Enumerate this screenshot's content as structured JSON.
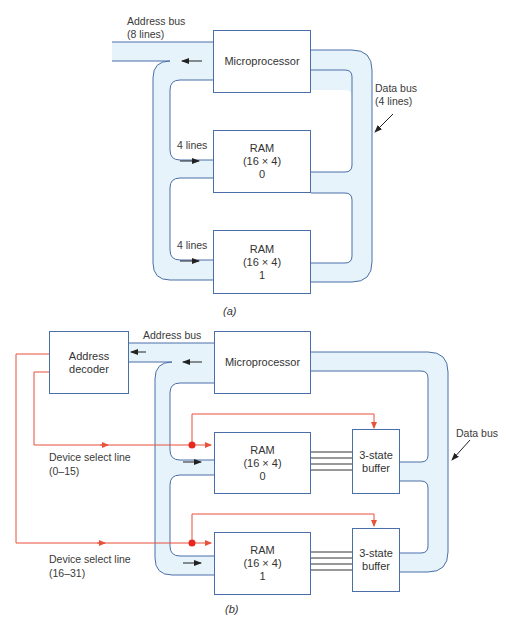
{
  "diagram_a": {
    "caption": "(a)",
    "address_bus_label_1": "Address bus",
    "address_bus_label_2": "(8 lines)",
    "data_bus_label_1": "Data bus",
    "data_bus_label_2": "(4 lines)",
    "microprocessor": "Microprocessor",
    "ram0": {
      "line1": "RAM",
      "line2": "(16 × 4)",
      "line3": "0",
      "lines_label": "4 lines"
    },
    "ram1": {
      "line1": "RAM",
      "line2": "(16 × 4)",
      "line3": "1",
      "lines_label": "4 lines"
    }
  },
  "diagram_b": {
    "caption": "(b)",
    "address_bus_label": "Address bus",
    "data_bus_label": "Data bus",
    "address_decoder_1": "Address",
    "address_decoder_2": "decoder",
    "microprocessor": "Microprocessor",
    "ram0": {
      "line1": "RAM",
      "line2": "(16 × 4)",
      "line3": "0"
    },
    "ram1": {
      "line1": "RAM",
      "line2": "(16 × 4)",
      "line3": "1"
    },
    "buffer0": {
      "line1": "3-state",
      "line2": "buffer"
    },
    "buffer1": {
      "line1": "3-state",
      "line2": "buffer"
    },
    "select0": {
      "line1": "Device select line",
      "line2": "(0–15)"
    },
    "select1": {
      "line1": "Device select line",
      "line2": "(16–31)"
    }
  },
  "colors": {
    "bus_fill": "#e6f3fa",
    "bus_stroke": "#4a6fa8",
    "select_line": "#e8513a",
    "node": "#e8281e"
  }
}
